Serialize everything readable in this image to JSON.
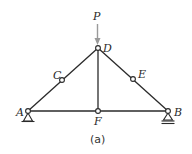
{
  "diagram": {
    "type": "truss",
    "caption": "(a)",
    "load": {
      "label": "P",
      "at_node": "D",
      "direction": "down",
      "color": "#9a9a9a"
    },
    "nodes": [
      {
        "id": "A",
        "label": "A",
        "x": 28,
        "y": 111,
        "support": "pin"
      },
      {
        "id": "C",
        "label": "C",
        "x": 62,
        "y": 80
      },
      {
        "id": "D",
        "label": "D",
        "x": 98,
        "y": 48
      },
      {
        "id": "E",
        "label": "E",
        "x": 133,
        "y": 79
      },
      {
        "id": "B",
        "label": "B",
        "x": 168,
        "y": 111,
        "support": "roller"
      },
      {
        "id": "F",
        "label": "F",
        "x": 98,
        "y": 111
      }
    ],
    "members": [
      [
        "A",
        "C"
      ],
      [
        "C",
        "D"
      ],
      [
        "D",
        "E"
      ],
      [
        "E",
        "B"
      ],
      [
        "A",
        "F"
      ],
      [
        "F",
        "B"
      ],
      [
        "D",
        "F"
      ]
    ],
    "colors": {
      "member": "#2a2a2a",
      "joint_fill": "#ffffff",
      "background": "#ffffff"
    }
  }
}
